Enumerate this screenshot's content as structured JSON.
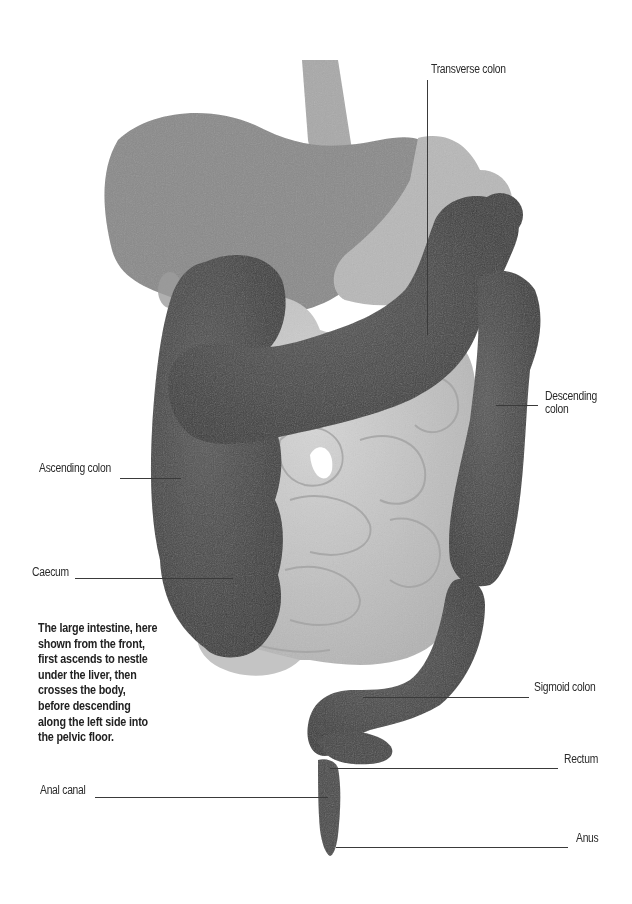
{
  "figure": {
    "colors": {
      "background": "#ffffff",
      "liver": "#8a8a8a",
      "stomach": "#b8b8b8",
      "oesophagus": "#a9a9a9",
      "small_intestine": "#c9c9c9",
      "large_intestine": "#4a4a4a",
      "label_text": "#2a2a2a",
      "leader_line": "#3a3a3a"
    }
  },
  "labels": {
    "transverse_colon": "Transverse colon",
    "descending_colon_line1": "Descending",
    "descending_colon_line2": "colon",
    "ascending_colon": "Ascending colon",
    "caecum": "Caecum",
    "sigmoid_colon": "Sigmoid colon",
    "rectum": "Rectum",
    "anal_canal": "Anal canal",
    "anus": "Anus"
  },
  "caption": {
    "lines": [
      "The large intestine, here",
      "shown from the front,",
      "first ascends to nestle",
      "under the liver, then",
      "crosses the body,",
      "before descending",
      "along the left side into",
      "the pelvic floor."
    ]
  }
}
